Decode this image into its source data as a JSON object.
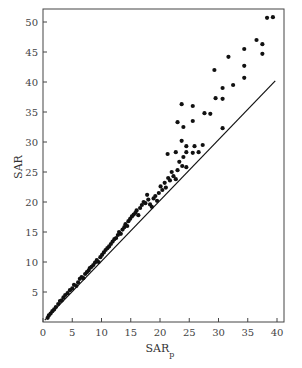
{
  "chart_data": {
    "type": "scatter",
    "title": "",
    "xlabel": "SAR",
    "xlabel_subscript": "p",
    "ylabel": "SAR",
    "xlim": [
      0,
      40.5
    ],
    "ylim": [
      0,
      52
    ],
    "xticks": [
      0,
      5,
      10,
      15,
      20,
      25,
      30,
      35,
      40
    ],
    "yticks": [
      5,
      10,
      15,
      20,
      25,
      30,
      35,
      40,
      45,
      50
    ],
    "grid": false,
    "legend": null,
    "reference_line": {
      "label": "1:1 line",
      "x": [
        0.3,
        39.7
      ],
      "y": [
        0.3,
        40.2
      ]
    },
    "series": [
      {
        "name": "observations",
        "color": "#111111",
        "points": [
          [
            0.8,
            0.7
          ],
          [
            1.0,
            1.1
          ],
          [
            1.3,
            1.4
          ],
          [
            1.6,
            1.8
          ],
          [
            1.9,
            2.1
          ],
          [
            2.2,
            2.5
          ],
          [
            2.6,
            3.0
          ],
          [
            2.9,
            3.5
          ],
          [
            3.2,
            3.6
          ],
          [
            3.5,
            4.1
          ],
          [
            3.8,
            4.5
          ],
          [
            4.2,
            4.8
          ],
          [
            4.6,
            5.3
          ],
          [
            5.0,
            5.6
          ],
          [
            5.3,
            6.2
          ],
          [
            5.7,
            6.0
          ],
          [
            6.0,
            6.6
          ],
          [
            6.3,
            7.2
          ],
          [
            6.6,
            7.5
          ],
          [
            6.9,
            7.3
          ],
          [
            7.2,
            8.0
          ],
          [
            7.5,
            8.3
          ],
          [
            7.8,
            8.6
          ],
          [
            8.0,
            9.0
          ],
          [
            8.3,
            9.2
          ],
          [
            8.6,
            9.5
          ],
          [
            8.9,
            9.9
          ],
          [
            9.2,
            10.3
          ],
          [
            9.5,
            10.0
          ],
          [
            9.8,
            10.8
          ],
          [
            10.1,
            11.2
          ],
          [
            10.4,
            11.6
          ],
          [
            10.7,
            12.0
          ],
          [
            11.0,
            12.3
          ],
          [
            11.3,
            12.6
          ],
          [
            11.6,
            13.0
          ],
          [
            11.9,
            13.4
          ],
          [
            12.2,
            13.8
          ],
          [
            12.5,
            14.0
          ],
          [
            12.8,
            14.5
          ],
          [
            13.0,
            15.0
          ],
          [
            13.3,
            14.7
          ],
          [
            13.6,
            15.4
          ],
          [
            13.9,
            15.8
          ],
          [
            14.1,
            16.3
          ],
          [
            14.4,
            16.0
          ],
          [
            14.6,
            16.8
          ],
          [
            14.9,
            17.2
          ],
          [
            15.2,
            17.6
          ],
          [
            15.5,
            17.9
          ],
          [
            15.8,
            18.2
          ],
          [
            16.0,
            18.6
          ],
          [
            16.3,
            17.8
          ],
          [
            16.6,
            19.0
          ],
          [
            16.9,
            19.5
          ],
          [
            17.2,
            20.0
          ],
          [
            17.5,
            19.8
          ],
          [
            17.8,
            21.2
          ],
          [
            18.0,
            20.4
          ],
          [
            18.3,
            19.6
          ],
          [
            18.6,
            19.2
          ],
          [
            18.9,
            20.6
          ],
          [
            19.2,
            21.0
          ],
          [
            19.5,
            20.2
          ],
          [
            19.8,
            21.5
          ],
          [
            20.1,
            22.6
          ],
          [
            20.4,
            22.0
          ],
          [
            20.8,
            23.2
          ],
          [
            21.0,
            22.4
          ],
          [
            21.4,
            24.0
          ],
          [
            21.7,
            23.6
          ],
          [
            22.0,
            25.0
          ],
          [
            22.3,
            24.3
          ],
          [
            22.7,
            23.8
          ],
          [
            23.0,
            25.3
          ],
          [
            23.3,
            26.7
          ],
          [
            23.8,
            26.0
          ],
          [
            24.0,
            27.5
          ],
          [
            24.5,
            25.8
          ],
          [
            21.3,
            28.0
          ],
          [
            22.7,
            28.3
          ],
          [
            23.7,
            30.2
          ],
          [
            24.5,
            29.3
          ],
          [
            24.5,
            28.3
          ],
          [
            25.6,
            28.2
          ],
          [
            25.9,
            29.3
          ],
          [
            26.6,
            28.3
          ],
          [
            27.3,
            29.5
          ],
          [
            23.0,
            33.3
          ],
          [
            24.0,
            32.5
          ],
          [
            25.6,
            33.5
          ],
          [
            30.7,
            32.3
          ],
          [
            27.6,
            34.8
          ],
          [
            28.6,
            34.7
          ],
          [
            23.7,
            36.3
          ],
          [
            25.6,
            36.0
          ],
          [
            29.5,
            37.3
          ],
          [
            30.7,
            37.2
          ],
          [
            30.7,
            39.0
          ],
          [
            32.5,
            39.5
          ],
          [
            34.4,
            40.7
          ],
          [
            34.4,
            42.7
          ],
          [
            29.3,
            42.0
          ],
          [
            31.7,
            44.2
          ],
          [
            34.4,
            45.5
          ],
          [
            36.5,
            47.0
          ],
          [
            37.5,
            46.3
          ],
          [
            37.5,
            44.7
          ],
          [
            38.3,
            50.7
          ],
          [
            39.3,
            50.8
          ]
        ]
      }
    ]
  }
}
